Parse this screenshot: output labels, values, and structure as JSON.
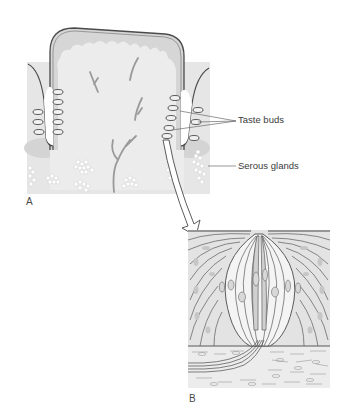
{
  "figure": {
    "panels": [
      {
        "id": "A",
        "letter": "A",
        "description": "Cross-section of a circumvallate papilla with surrounding trench",
        "labels": [
          {
            "text": "Taste buds",
            "leader_count": 3
          },
          {
            "text": "Serous glands",
            "leader_count": 1
          }
        ]
      },
      {
        "id": "B",
        "letter": "B",
        "description": "Enlarged single taste bud in epithelium with nerve fibers"
      }
    ],
    "labels": {
      "taste_buds": "Taste buds",
      "serous_glands": "Serous glands",
      "panel_a": "A",
      "panel_b": "B"
    },
    "colors": {
      "background": "#ffffff",
      "tissue_light": "#ebebeb",
      "tissue_mid": "#d9d9d9",
      "epithelium": "#cfcfcf",
      "outline": "#4a4a4a",
      "nerve": "#9a9a9a",
      "label_text": "#3a3a3a",
      "nucleus": "#bdbdbd"
    }
  }
}
